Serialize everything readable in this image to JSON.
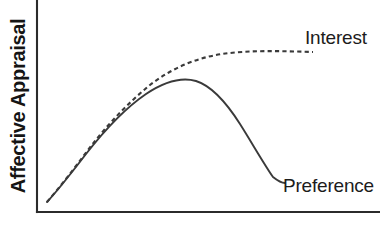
{
  "chart_data": {
    "type": "line",
    "title": "",
    "xlabel": "",
    "ylabel": "Affective Appraisal",
    "grid": false,
    "legend_position": "inline-right-of-curves",
    "axis_ticks": false,
    "xlim": [
      0,
      1
    ],
    "ylim": [
      0,
      1
    ],
    "annotations": [
      "Interest rises monotonically and saturates at a high plateau",
      "Preference rises to a peak then falls steeply (inverted-U)"
    ],
    "series": [
      {
        "name": "Interest",
        "style": "dashed",
        "color": "#3a3a3a",
        "label": "Interest",
        "x": [
          0.03,
          0.09,
          0.15,
          0.22,
          0.3,
          0.38,
          0.46,
          0.55,
          0.62,
          0.7,
          0.78,
          0.86,
          0.93,
          1.0
        ],
        "y": [
          0.06,
          0.18,
          0.3,
          0.42,
          0.53,
          0.63,
          0.71,
          0.77,
          0.81,
          0.83,
          0.845,
          0.85,
          0.855,
          0.855
        ]
      },
      {
        "name": "Preference",
        "style": "solid",
        "color": "#3a3a3a",
        "label": "Preference",
        "x": [
          0.03,
          0.09,
          0.15,
          0.22,
          0.3,
          0.38,
          0.46,
          0.52,
          0.58,
          0.64,
          0.7,
          0.76,
          0.82,
          0.88,
          0.92
        ],
        "y": [
          0.06,
          0.18,
          0.29,
          0.4,
          0.5,
          0.58,
          0.64,
          0.655,
          0.65,
          0.62,
          0.55,
          0.44,
          0.3,
          0.16,
          0.09
        ]
      }
    ],
    "geometry": {
      "axis_origin": [
        37,
        212
      ],
      "y_axis_top": [
        37,
        0
      ],
      "x_axis_right": [
        380,
        212
      ],
      "curves_start": [
        47,
        202
      ],
      "curves_diverge_x": 78,
      "preference_peak": [
        196,
        81
      ],
      "preference_end": [
        285,
        183
      ],
      "interest_plateau_y": 52,
      "interest_end": [
        313,
        52
      ],
      "solid_path": "M47,202 C60,188 72,172 86,154 C104,131 124,109 146,94 C164,82 182,77 196,81 C212,86 226,102 240,124 C252,143 264,164 273,177 C278,181 282,183 285,183",
      "dashed_path": "M47,202 C60,187 73,170 88,150 C106,126 128,103 150,85 C172,68 196,58 222,54 C250,50 282,51 313,52"
    }
  },
  "labels": {
    "interest": "Interest",
    "preference": "Preference",
    "y_axis": "Affective Appraisal"
  },
  "icons": {
    "y_axis_line": "vertical-axis-line",
    "x_axis_line": "horizontal-axis-line"
  }
}
